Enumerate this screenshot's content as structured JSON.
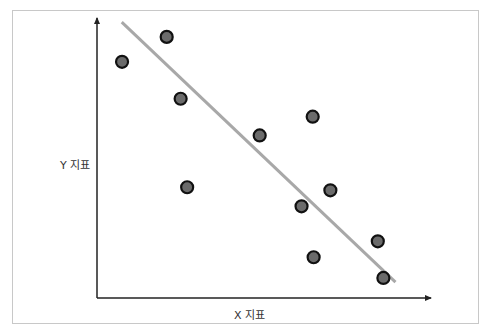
{
  "chart_data": {
    "type": "scatter",
    "title": "",
    "xlabel": "X 지표",
    "ylabel": "Y 지표",
    "grid": false,
    "legend": null,
    "axis_ticks": "none",
    "note": "Values in normalized units (0-100) estimated from pixel positions; axes have no tick labels",
    "points": [
      {
        "x": 5.5,
        "y": 81.5
      },
      {
        "x": 19.9,
        "y": 90.4
      },
      {
        "x": 24.4,
        "y": 68.3
      },
      {
        "x": 26.5,
        "y": 36.7
      },
      {
        "x": 49.9,
        "y": 55.2
      },
      {
        "x": 67.0,
        "y": 61.9
      },
      {
        "x": 63.4,
        "y": 29.9
      },
      {
        "x": 72.7,
        "y": 35.6
      },
      {
        "x": 67.3,
        "y": 11.7
      },
      {
        "x": 88.0,
        "y": 17.4
      },
      {
        "x": 89.8,
        "y": 4.3
      }
    ],
    "trendline": {
      "type": "linear",
      "start": {
        "x": 5.4,
        "y": 95.7
      },
      "end": {
        "x": 93.7,
        "y": 2.8
      }
    },
    "colors": {
      "point_fill": "#6b6b6b",
      "point_stroke": "#111111",
      "trendline": "#a8a8a8",
      "axis": "#222222"
    }
  },
  "labels": {
    "x_axis": "X 지표",
    "y_axis": "Y 지표"
  }
}
